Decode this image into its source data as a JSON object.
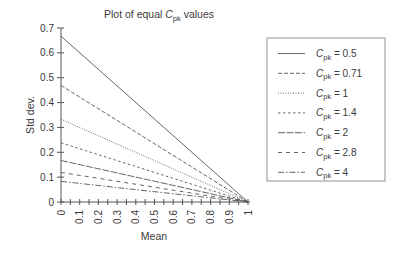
{
  "chart_data": {
    "type": "line",
    "title": "Plot of equal Cpk values",
    "title_parts": {
      "prefix": "Plot of equal ",
      "var": "C",
      "sub": "pk",
      "suffix": " values"
    },
    "xlabel": "Mean",
    "ylabel": "Std dev.",
    "xlim": [
      0,
      1
    ],
    "ylim": [
      0,
      0.7
    ],
    "x_ticks": [
      "0",
      "0.1",
      "0.2",
      "0.3",
      "0.4",
      "0.5",
      "0.6",
      "0.7",
      "0.8",
      "0.9",
      "1"
    ],
    "x_minor_step": 0.05,
    "y_ticks": [
      "0",
      "0.1",
      "0.2",
      "0.3",
      "0.4",
      "0.5",
      "0.6",
      "0.7"
    ],
    "grid": false,
    "legend_position": "right",
    "series": [
      {
        "name": "Cpk = 0.5",
        "cpk": "0.5",
        "dash": "",
        "x": [
          0,
          1
        ],
        "values": [
          0.667,
          0
        ]
      },
      {
        "name": "Cpk = 0.71",
        "cpk": "0.71",
        "dash": "4,2",
        "x": [
          0,
          1
        ],
        "values": [
          0.469,
          0
        ]
      },
      {
        "name": "Cpk = 1",
        "cpk": "1",
        "dash": "1,1.5",
        "x": [
          0,
          1
        ],
        "values": [
          0.333,
          0
        ]
      },
      {
        "name": "Cpk = 1.4",
        "cpk": "1.4",
        "dash": "2.5,2.5",
        "x": [
          0,
          1
        ],
        "values": [
          0.238,
          0
        ]
      },
      {
        "name": "Cpk = 2",
        "cpk": "2",
        "dash": "7,1.5",
        "x": [
          0,
          1
        ],
        "values": [
          0.167,
          0
        ]
      },
      {
        "name": "Cpk = 2.8",
        "cpk": "2.8",
        "dash": "4,4",
        "x": [
          0,
          1
        ],
        "values": [
          0.119,
          0
        ]
      },
      {
        "name": "Cpk = 4",
        "cpk": "4",
        "dash": "6,2,1.5,2",
        "x": [
          0,
          1
        ],
        "values": [
          0.083,
          0
        ]
      }
    ]
  },
  "colors": {
    "line": "#555555",
    "axis": "#555555",
    "text": "#3a3a3a",
    "legend_border": "#777777"
  }
}
